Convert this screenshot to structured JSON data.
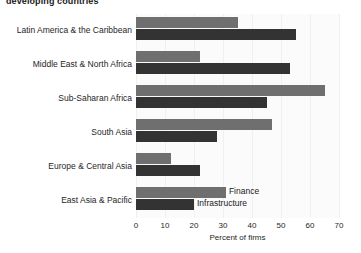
{
  "chart_data": {
    "type": "bar",
    "orientation": "horizontal",
    "title": "developing countries",
    "xlabel": "Percent of firms",
    "ylabel": "",
    "xlim": [
      0,
      70
    ],
    "xticks": [
      0,
      10,
      20,
      30,
      40,
      50,
      60,
      70
    ],
    "grid": true,
    "legend_position": "inline-on-bars",
    "categories": [
      "Latin America & the Caribbean",
      "Middle East & North Africa",
      "Sub-Saharan Africa",
      "South Asia",
      "Europe & Central Asia",
      "East Asia & Pacific"
    ],
    "series": [
      {
        "name": "Finance",
        "color": "#6f6f6f",
        "values": [
          35,
          22,
          65,
          47,
          12,
          31
        ]
      },
      {
        "name": "Infrastructure",
        "color": "#333333",
        "values": [
          55,
          53,
          45,
          28,
          22,
          20
        ]
      }
    ]
  },
  "axis": {
    "tick_labels": [
      "0",
      "10",
      "20",
      "30",
      "40",
      "50",
      "60",
      "70"
    ],
    "title": "Percent of firms"
  },
  "legend": {
    "finance_label": "Finance",
    "infrastructure_label": "Infrastructure"
  },
  "colors": {
    "finance": "#6f6f6f",
    "infrastructure": "#333333",
    "plot_background": "#fbfbfb",
    "gridline": "#f0f0f0",
    "text": "#262626"
  }
}
